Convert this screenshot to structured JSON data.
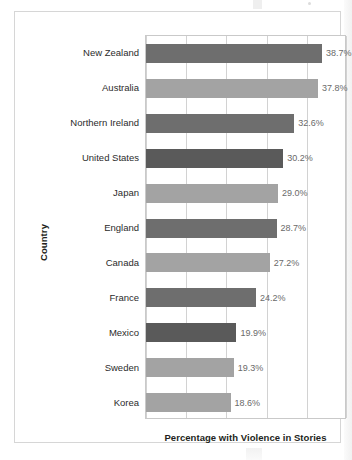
{
  "figure": {
    "y_axis_title": "Country",
    "x_axis_title": "Percentage with Violence in Stories"
  },
  "colors": {
    "bar_dark": "#6e6e6e",
    "bar_darkest": "#5a5a5a",
    "bar_light": "#a3a3a3",
    "gridline": "#d2d2d2",
    "plot_border": "#c9c9c9",
    "frame_border": "#d6d6d6",
    "value_text": "#6a6a6a",
    "label_text": "#2b2b2b",
    "axis_title_text": "#231f20",
    "background": "#ffffff"
  },
  "chart_data": {
    "type": "bar",
    "orientation": "horizontal",
    "title": "",
    "xlabel": "Percentage with Violence in Stories",
    "ylabel": "Country",
    "xlim": [
      0,
      44.2
    ],
    "grid": true,
    "gridlines_x": [
      0,
      8.84,
      17.68,
      26.52,
      35.36,
      44.2
    ],
    "legend": null,
    "categories": [
      "New Zealand",
      "Australia",
      "Northern Ireland",
      "United States",
      "Japan",
      "England",
      "Canada",
      "France",
      "Mexico",
      "Sweden",
      "Korea"
    ],
    "values": [
      38.7,
      37.8,
      32.6,
      30.2,
      29.0,
      28.7,
      27.2,
      24.2,
      19.9,
      19.3,
      18.6
    ],
    "data_labels": [
      "38.7%",
      "37.8%",
      "32.6%",
      "30.2%",
      "29.0%",
      "28.7%",
      "27.2%",
      "24.2%",
      "19.9%",
      "19.3%",
      "18.6%"
    ],
    "bar_shades": [
      "dark",
      "light",
      "dark",
      "darkest",
      "light",
      "dark",
      "light",
      "dark",
      "darkest",
      "light",
      "light"
    ]
  }
}
